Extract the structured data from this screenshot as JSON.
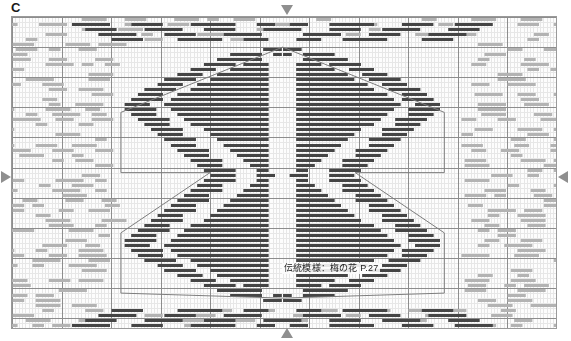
{
  "plate": {
    "letter": "C"
  },
  "caption": {
    "text": "伝統模様：梅の花  P.27"
  },
  "markers": [
    {
      "name": "center-marker-top",
      "direction": "down",
      "glyph": "▼"
    },
    {
      "name": "center-marker-bottom",
      "direction": "up",
      "glyph": "▲"
    },
    {
      "name": "center-marker-left",
      "direction": "right",
      "glyph": "▶"
    },
    {
      "name": "center-marker-right",
      "direction": "left",
      "glyph": "◀"
    }
  ],
  "colors": {
    "page_background": "#ffffff",
    "chart_background": "#fdfdfd",
    "frame_border": "#9a9a9a",
    "minor_grid": "#e7e7e7",
    "major_grid": "#8d8d8d",
    "stitch_dark": "#454545",
    "stitch_light": "#b3b3b3",
    "guide_line": "#7d7d7d",
    "text": "#1c1c1c",
    "marker": "#8f8f8f"
  },
  "chart_data": {
    "type": "grid-pattern",
    "title": "伝統模様：梅の花  P.27",
    "plate_label": "C",
    "grid": {
      "cols": 165,
      "rows": 62,
      "cell_w": 3.3,
      "cell_h": 5.02,
      "minor_grid": true,
      "major_grid_every_cols": 15,
      "major_grid_every_rows": 6,
      "origin_col": 82,
      "origin_row": 31
    },
    "stitch": {
      "shape": "horizontal-dash",
      "typical_length_cells": 6,
      "height_px": 3
    },
    "legend": [
      {
        "name": "central-motif-stitch",
        "color": "#454545",
        "label": "main motif stitching"
      },
      {
        "name": "ground-fill-stitch",
        "color": "#b3b3b3",
        "label": "ground / background stitching"
      }
    ],
    "guides": {
      "shape": "hexagon",
      "stroke": "#7d7d7d",
      "points_cells": [
        [
          82,
          6
        ],
        [
          131,
          19
        ],
        [
          131,
          31
        ],
        [
          104,
          31
        ],
        [
          131,
          43
        ],
        [
          131,
          55
        ],
        [
          82,
          56
        ],
        [
          33,
          55
        ],
        [
          33,
          43
        ],
        [
          60,
          31
        ],
        [
          33,
          31
        ],
        [
          33,
          19
        ]
      ]
    },
    "axis_markers": {
      "top": "▼",
      "bottom": "▲",
      "left": "▶",
      "right": "◀"
    }
  }
}
